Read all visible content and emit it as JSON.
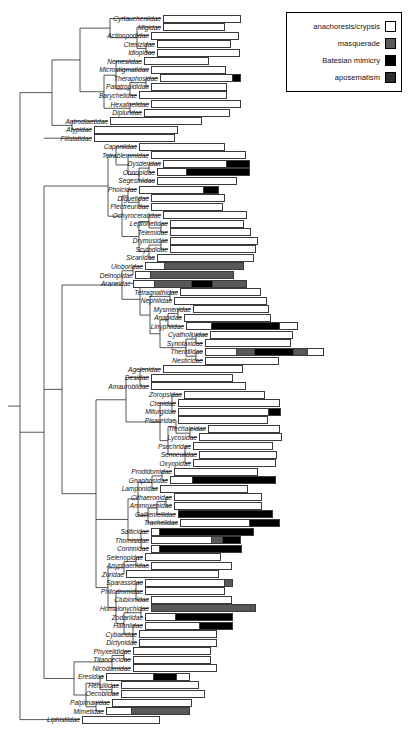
{
  "legend": {
    "title": "",
    "items": [
      {
        "label": "anachoresis/crypsis",
        "color": "#ffffff",
        "key": "crypsis"
      },
      {
        "label": "masquerade",
        "color": "#595959",
        "key": "masquerade"
      },
      {
        "label": "Batesian mimicry",
        "color": "#000000",
        "key": "batesian"
      },
      {
        "label": "aposematism",
        "color": "#2e2e2e",
        "key": "aposematism"
      }
    ]
  },
  "chart_data": {
    "type": "bar",
    "subtype": "stacked-horizontal-bars-on-phylogeny",
    "title": "",
    "xlabel": "",
    "ylabel": "",
    "grid": false,
    "legend_position": "top-right",
    "categories_axis": "spider families (phylogenetic order, top to bottom)",
    "series": [
      {
        "name": "anachoresis/crypsis",
        "color": "#ffffff"
      },
      {
        "name": "masquerade",
        "color": "#595959"
      },
      {
        "name": "Batesian mimicry",
        "color": "#000000"
      },
      {
        "name": "aposematism",
        "color": "#2e2e2e"
      }
    ],
    "rows": [
      {
        "label": "Cyrtaucheniidae",
        "start": 163,
        "len": 78,
        "segs": [
          {
            "k": "crypsis",
            "w": 78
          }
        ]
      },
      {
        "label": "Migidae",
        "start": 163,
        "len": 62,
        "segs": [
          {
            "k": "crypsis",
            "w": 62
          }
        ]
      },
      {
        "label": "Actinopodidae",
        "start": 151,
        "len": 88,
        "segs": [
          {
            "k": "crypsis",
            "w": 88
          }
        ]
      },
      {
        "label": "Ctenizidae",
        "start": 157,
        "len": 74,
        "segs": [
          {
            "k": "crypsis",
            "w": 74
          }
        ]
      },
      {
        "label": "Idiopidae",
        "start": 157,
        "len": 83,
        "segs": [
          {
            "k": "crypsis",
            "w": 83
          }
        ]
      },
      {
        "label": "Nemesiidae",
        "start": 144,
        "len": 65,
        "segs": [
          {
            "k": "crypsis",
            "w": 65
          }
        ]
      },
      {
        "label": "Microstigmatidae",
        "start": 151,
        "len": 75,
        "segs": [
          {
            "k": "crypsis",
            "w": 75
          }
        ]
      },
      {
        "label": "Theraphosidae",
        "start": 160,
        "len": 81,
        "segs": [
          {
            "k": "crypsis",
            "w": 74
          },
          {
            "k": "batesian",
            "w": 7
          }
        ]
      },
      {
        "label": "Paratropididae",
        "start": 151,
        "len": 76,
        "segs": [
          {
            "k": "crypsis",
            "w": 76
          }
        ]
      },
      {
        "label": "Barychelidae",
        "start": 139,
        "len": 88,
        "segs": [
          {
            "k": "crypsis",
            "w": 88
          }
        ]
      },
      {
        "label": "Hexathelidae",
        "start": 151,
        "len": 90,
        "segs": [
          {
            "k": "crypsis",
            "w": 90
          }
        ]
      },
      {
        "label": "Dipluridae",
        "start": 144,
        "len": 86,
        "segs": [
          {
            "k": "crypsis",
            "w": 86
          }
        ]
      },
      {
        "label": "Antrodiaetidae",
        "start": 110,
        "len": 92,
        "segs": [
          {
            "k": "crypsis",
            "w": 92
          }
        ]
      },
      {
        "label": "Atypidae",
        "start": 94,
        "len": 84,
        "segs": [
          {
            "k": "crypsis",
            "w": 84
          }
        ]
      },
      {
        "label": "Filistatidae",
        "start": 94,
        "len": 81,
        "segs": [
          {
            "k": "crypsis",
            "w": 81
          }
        ]
      },
      {
        "label": "Caponiidae",
        "start": 139,
        "len": 86,
        "segs": [
          {
            "k": "crypsis",
            "w": 86
          }
        ]
      },
      {
        "label": "Tetrablemmidae",
        "start": 151,
        "len": 95,
        "segs": [
          {
            "k": "crypsis",
            "w": 95
          }
        ]
      },
      {
        "label": "Dysderidae",
        "start": 163,
        "len": 87,
        "segs": [
          {
            "k": "crypsis",
            "w": 64
          },
          {
            "k": "batesian",
            "w": 23
          }
        ]
      },
      {
        "label": "Oonopidae",
        "start": 157,
        "len": 93,
        "segs": [
          {
            "k": "crypsis",
            "w": 29
          },
          {
            "k": "batesian",
            "w": 64
          }
        ]
      },
      {
        "label": "Segestriidae",
        "start": 157,
        "len": 80,
        "segs": [
          {
            "k": "crypsis",
            "w": 80
          }
        ]
      },
      {
        "label": "Pholcidae",
        "start": 139,
        "len": 80,
        "segs": [
          {
            "k": "crypsis",
            "w": 65
          },
          {
            "k": "batesian",
            "w": 15
          }
        ]
      },
      {
        "label": "Diguetidae",
        "start": 151,
        "len": 74,
        "segs": [
          {
            "k": "crypsis",
            "w": 74
          }
        ]
      },
      {
        "label": "Plectreuridae",
        "start": 151,
        "len": 72,
        "segs": [
          {
            "k": "crypsis",
            "w": 72
          }
        ]
      },
      {
        "label": "Ochyroceratidae",
        "start": 163,
        "len": 84,
        "segs": [
          {
            "k": "crypsis",
            "w": 84
          }
        ]
      },
      {
        "label": "Leptonetidae",
        "start": 170,
        "len": 74,
        "segs": [
          {
            "k": "crypsis",
            "w": 74
          }
        ]
      },
      {
        "label": "Telemidae",
        "start": 170,
        "len": 81,
        "segs": [
          {
            "k": "crypsis",
            "w": 81
          }
        ]
      },
      {
        "label": "Drymusidae",
        "start": 170,
        "len": 88,
        "segs": [
          {
            "k": "crypsis",
            "w": 88
          }
        ]
      },
      {
        "label": "Scytodidae",
        "start": 170,
        "len": 86,
        "segs": [
          {
            "k": "crypsis",
            "w": 86
          }
        ]
      },
      {
        "label": "Sicariidae",
        "start": 157,
        "len": 97,
        "segs": [
          {
            "k": "crypsis",
            "w": 97
          }
        ]
      },
      {
        "label": "Uloboridae",
        "start": 145,
        "len": 99,
        "segs": [
          {
            "k": "crypsis",
            "w": 19
          },
          {
            "k": "masquerade",
            "w": 80
          }
        ]
      },
      {
        "label": "Deinopidae",
        "start": 135,
        "len": 99,
        "segs": [
          {
            "k": "crypsis",
            "w": 14
          },
          {
            "k": "masquerade",
            "w": 85
          }
        ]
      },
      {
        "label": "Araneidae",
        "start": 133,
        "len": 114,
        "segs": [
          {
            "k": "crypsis",
            "w": 21
          },
          {
            "k": "masquerade",
            "w": 38
          },
          {
            "k": "batesian",
            "w": 20
          },
          {
            "k": "masquerade",
            "w": 35
          }
        ]
      },
      {
        "label": "Tetragnathidae",
        "start": 180,
        "len": 81,
        "segs": [
          {
            "k": "crypsis",
            "w": 81
          }
        ]
      },
      {
        "label": "Nephilidae",
        "start": 174,
        "len": 93,
        "segs": [
          {
            "k": "crypsis",
            "w": 93
          }
        ]
      },
      {
        "label": "Mysmenidae",
        "start": 193,
        "len": 76,
        "segs": [
          {
            "k": "crypsis",
            "w": 76
          }
        ]
      },
      {
        "label": "Anapidae",
        "start": 184,
        "len": 87,
        "segs": [
          {
            "k": "crypsis",
            "w": 87
          }
        ]
      },
      {
        "label": "Linyphiidae",
        "start": 186,
        "len": 112,
        "segs": [
          {
            "k": "crypsis",
            "w": 25
          },
          {
            "k": "batesian",
            "w": 69
          },
          {
            "k": "crypsis",
            "w": 18
          }
        ]
      },
      {
        "label": "Cyatholipidae",
        "start": 210,
        "len": 83,
        "segs": [
          {
            "k": "crypsis",
            "w": 83
          }
        ]
      },
      {
        "label": "Synotaxidae",
        "start": 205,
        "len": 86,
        "segs": [
          {
            "k": "crypsis",
            "w": 86
          }
        ]
      },
      {
        "label": "Theridiidae",
        "start": 205,
        "len": 119,
        "segs": [
          {
            "k": "crypsis",
            "w": 32
          },
          {
            "k": "masquerade",
            "w": 18
          },
          {
            "k": "batesian",
            "w": 39
          },
          {
            "k": "masquerade",
            "w": 14
          },
          {
            "k": "crypsis",
            "w": 16
          }
        ]
      },
      {
        "label": "Nesticidae",
        "start": 205,
        "len": 74,
        "segs": [
          {
            "k": "crypsis",
            "w": 74
          }
        ]
      },
      {
        "label": "Agelenidae",
        "start": 163,
        "len": 80,
        "segs": [
          {
            "k": "crypsis",
            "w": 80
          }
        ]
      },
      {
        "label": "Desidae",
        "start": 151,
        "len": 82,
        "segs": [
          {
            "k": "crypsis",
            "w": 82
          }
        ]
      },
      {
        "label": "Amaurobiidae",
        "start": 151,
        "len": 95,
        "segs": [
          {
            "k": "crypsis",
            "w": 95
          }
        ]
      },
      {
        "label": "Zoropsidae",
        "start": 184,
        "len": 81,
        "segs": [
          {
            "k": "crypsis",
            "w": 81
          }
        ]
      },
      {
        "label": "Ctenidae",
        "start": 178,
        "len": 102,
        "segs": [
          {
            "k": "crypsis",
            "w": 102
          }
        ]
      },
      {
        "label": "Miturgidae",
        "start": 178,
        "len": 103,
        "segs": [
          {
            "k": "crypsis",
            "w": 92
          },
          {
            "k": "batesian",
            "w": 11
          }
        ]
      },
      {
        "label": "Pisauridae",
        "start": 178,
        "len": 90,
        "segs": [
          {
            "k": "crypsis",
            "w": 90
          }
        ]
      },
      {
        "label": "Trechaleidae",
        "start": 208,
        "len": 72,
        "segs": [
          {
            "k": "crypsis",
            "w": 72
          }
        ]
      },
      {
        "label": "Lycosidae",
        "start": 199,
        "len": 83,
        "segs": [
          {
            "k": "crypsis",
            "w": 83
          }
        ]
      },
      {
        "label": "Psechridae",
        "start": 193,
        "len": 80,
        "segs": [
          {
            "k": "crypsis",
            "w": 80
          }
        ]
      },
      {
        "label": "Senoculidae",
        "start": 199,
        "len": 78,
        "segs": [
          {
            "k": "crypsis",
            "w": 78
          }
        ]
      },
      {
        "label": "Oxyopidae",
        "start": 193,
        "len": 83,
        "segs": [
          {
            "k": "crypsis",
            "w": 83
          }
        ]
      },
      {
        "label": "Prodidomidae",
        "start": 174,
        "len": 84,
        "segs": [
          {
            "k": "crypsis",
            "w": 84
          }
        ]
      },
      {
        "label": "Gnaphosidae",
        "start": 170,
        "len": 106,
        "segs": [
          {
            "k": "crypsis",
            "w": 22
          },
          {
            "k": "batesian",
            "w": 84
          }
        ]
      },
      {
        "label": "Lamponidae",
        "start": 160,
        "len": 88,
        "segs": [
          {
            "k": "crypsis",
            "w": 88
          }
        ]
      },
      {
        "label": "Cithaeronidae",
        "start": 174,
        "len": 88,
        "segs": [
          {
            "k": "crypsis",
            "w": 88
          }
        ]
      },
      {
        "label": "Ammoxenidae",
        "start": 174,
        "len": 88,
        "segs": [
          {
            "k": "crypsis",
            "w": 88
          }
        ]
      },
      {
        "label": "Gallieniellidae",
        "start": 178,
        "len": 95,
        "segs": [
          {
            "k": "batesian",
            "w": 95
          }
        ]
      },
      {
        "label": "Trachelidae",
        "start": 180,
        "len": 100,
        "segs": [
          {
            "k": "crypsis",
            "w": 70
          },
          {
            "k": "batesian",
            "w": 30
          }
        ]
      },
      {
        "label": "Salticidae",
        "start": 151,
        "len": 103,
        "segs": [
          {
            "k": "crypsis",
            "w": 7
          },
          {
            "k": "batesian",
            "w": 96
          }
        ]
      },
      {
        "label": "Thomisidae",
        "start": 151,
        "len": 90,
        "segs": [
          {
            "k": "crypsis",
            "w": 62
          },
          {
            "k": "masquerade",
            "w": 10
          },
          {
            "k": "batesian",
            "w": 18
          }
        ]
      },
      {
        "label": "Corinnidae",
        "start": 151,
        "len": 91,
        "segs": [
          {
            "k": "crypsis",
            "w": 7
          },
          {
            "k": "batesian",
            "w": 84
          }
        ]
      },
      {
        "label": "Selenopidae",
        "start": 145,
        "len": 76,
        "segs": [
          {
            "k": "crypsis",
            "w": 76
          }
        ]
      },
      {
        "label": "Anyphaenidae",
        "start": 151,
        "len": 81,
        "segs": [
          {
            "k": "crypsis",
            "w": 81
          }
        ]
      },
      {
        "label": "Zoridae",
        "start": 126,
        "len": 93,
        "segs": [
          {
            "k": "crypsis",
            "w": 93
          }
        ]
      },
      {
        "label": "Sparassidae",
        "start": 145,
        "len": 88,
        "segs": [
          {
            "k": "crypsis",
            "w": 81
          },
          {
            "k": "masquerade",
            "w": 7
          }
        ]
      },
      {
        "label": "Philodromidae",
        "start": 145,
        "len": 80,
        "segs": [
          {
            "k": "crypsis",
            "w": 80
          }
        ]
      },
      {
        "label": "Clubionidae",
        "start": 151,
        "len": 81,
        "segs": [
          {
            "k": "crypsis",
            "w": 81
          }
        ]
      },
      {
        "label": "Homalonychidae",
        "start": 151,
        "len": 105,
        "segs": [
          {
            "k": "masquerade",
            "w": 105
          }
        ]
      },
      {
        "label": "Zodariidae",
        "start": 145,
        "len": 88,
        "segs": [
          {
            "k": "crypsis",
            "w": 30
          },
          {
            "k": "batesian",
            "w": 58
          }
        ]
      },
      {
        "label": "Hahniidae",
        "start": 145,
        "len": 88,
        "segs": [
          {
            "k": "crypsis",
            "w": 55
          },
          {
            "k": "batesian",
            "w": 33
          }
        ]
      },
      {
        "label": "Cybaeidae",
        "start": 139,
        "len": 78,
        "segs": [
          {
            "k": "crypsis",
            "w": 78
          }
        ]
      },
      {
        "label": "Dictynidae",
        "start": 139,
        "len": 78,
        "segs": [
          {
            "k": "crypsis",
            "w": 78
          }
        ]
      },
      {
        "label": "Phyxelididae",
        "start": 133,
        "len": 78,
        "segs": [
          {
            "k": "crypsis",
            "w": 78
          }
        ]
      },
      {
        "label": "Titanoecidae",
        "start": 133,
        "len": 78,
        "segs": [
          {
            "k": "crypsis",
            "w": 78
          }
        ]
      },
      {
        "label": "Nicodamidae",
        "start": 133,
        "len": 84,
        "segs": [
          {
            "k": "crypsis",
            "w": 84
          }
        ]
      },
      {
        "label": "Eresidae",
        "start": 106,
        "len": 84,
        "segs": [
          {
            "k": "crypsis",
            "w": 48
          },
          {
            "k": "batesian",
            "w": 23
          },
          {
            "k": "crypsis",
            "w": 13
          }
        ]
      },
      {
        "label": "Hersiliidae",
        "start": 121,
        "len": 78,
        "segs": [
          {
            "k": "crypsis",
            "w": 78
          }
        ]
      },
      {
        "label": "Oecobiidae",
        "start": 121,
        "len": 84,
        "segs": [
          {
            "k": "crypsis",
            "w": 84
          }
        ]
      },
      {
        "label": "Palpimanidae",
        "start": 112,
        "len": 80,
        "segs": [
          {
            "k": "crypsis",
            "w": 80
          }
        ]
      },
      {
        "label": "Mimetidae",
        "start": 106,
        "len": 84,
        "segs": [
          {
            "k": "crypsis",
            "w": 25
          },
          {
            "k": "masquerade",
            "w": 59
          }
        ]
      },
      {
        "label": "Liphistiidae",
        "start": 82,
        "len": 78,
        "segs": [
          {
            "k": "crypsis",
            "w": 78
          }
        ]
      }
    ]
  }
}
